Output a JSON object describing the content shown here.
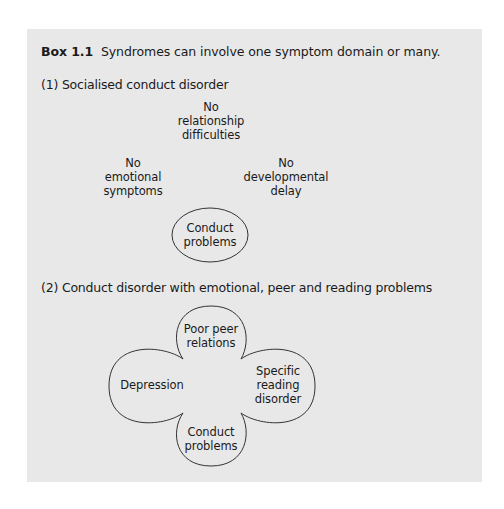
{
  "box": {
    "label": "Box 1.1",
    "caption": "Syndromes can involve one symptom domain or many."
  },
  "section1": {
    "heading": "(1) Socialised conduct disorder",
    "nodes": {
      "top": "No\nrelationship\ndifficulties",
      "left": "No\nemotional\nsymptoms",
      "right": "No\ndevelopmental\ndelay",
      "center": "Conduct\nproblems"
    }
  },
  "section2": {
    "heading": "(2) Conduct disorder with emotional, peer and reading problems",
    "lobes": {
      "top": "Poor peer\nrelations",
      "left": "Depression",
      "right": "Specific\nreading\ndisorder",
      "bottom": "Conduct\nproblems"
    }
  },
  "colors": {
    "box_background": "#e8e8e8",
    "line": "#333333",
    "text": "#1a1a1a"
  }
}
